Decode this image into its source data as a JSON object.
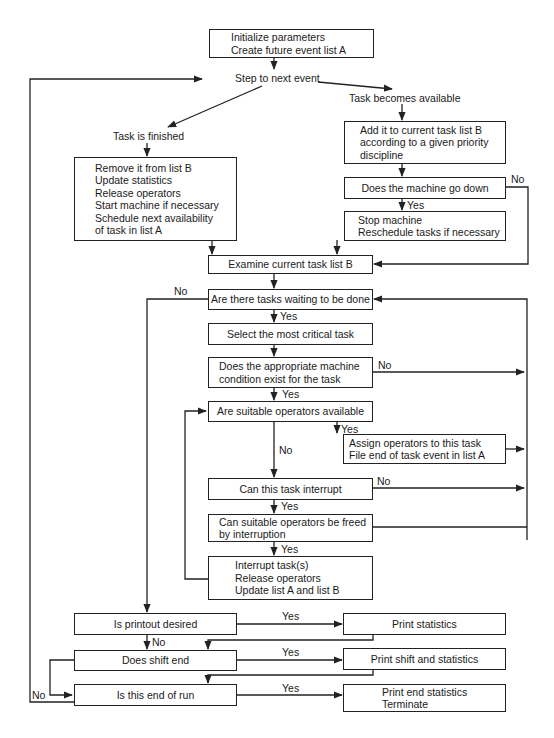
{
  "diagram": {
    "type": "flowchart",
    "nodes": {
      "init": [
        "Initialize parameters",
        "Create future event list A"
      ],
      "step": "Step to next event",
      "task_finished": "Task is finished",
      "task_available": "Task becomes available",
      "remove": [
        "Remove it from list B",
        "Update statistics",
        "Release operators",
        "Start machine if necessary",
        "Schedule next availability",
        "of task in list A"
      ],
      "add": [
        "Add it to current task list B",
        "according to a given priority",
        "discipline"
      ],
      "machine_down": "Does the machine go down",
      "stop_machine": [
        "Stop machine",
        "Reschedule tasks if necessary"
      ],
      "examine": "Examine current task list B",
      "tasks_waiting": "Are there tasks waiting to be done",
      "select": "Select the most critical task",
      "machine_condition": [
        "Does the appropriate machine",
        "condition exist for the task"
      ],
      "operators_available": "Are suitable operators available",
      "assign": [
        "Assign operators to this task",
        "File end of task event in list A"
      ],
      "can_interrupt": "Can this task interrupt",
      "can_free": [
        "Can suitable operators be freed",
        "by interruption"
      ],
      "interrupt": [
        "Interrupt task(s)",
        "Release operators",
        "Update list A and list B"
      ],
      "printout": "Is printout desired",
      "print_stats": "Print statistics",
      "shift_end": "Does shift end",
      "print_shift": "Print shift and statistics",
      "end_run": "Is this end of run",
      "print_end": [
        "Print end statistics",
        "Terminate"
      ]
    },
    "edge_labels": {
      "yes": "Yes",
      "no": "No"
    }
  }
}
